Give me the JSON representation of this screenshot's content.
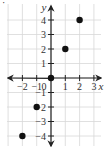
{
  "chart_data": {
    "type": "scatter",
    "title": "",
    "xlabel": "x",
    "ylabel": "y",
    "xlim": [
      -3,
      3.5
    ],
    "ylim": [
      -5,
      5
    ],
    "grid": true,
    "x_ticks": [
      "-2",
      "-1",
      "0",
      "1",
      "2",
      "3"
    ],
    "y_ticks": [
      "4",
      "3",
      "2",
      "1",
      "-1",
      "-2",
      "-3",
      "-4"
    ],
    "series": [
      {
        "name": "points",
        "points": [
          [
            -2,
            -4
          ],
          [
            -1,
            -2
          ],
          [
            0,
            0
          ],
          [
            1,
            2
          ],
          [
            2,
            4
          ]
        ]
      }
    ],
    "corner_mark": "·"
  }
}
